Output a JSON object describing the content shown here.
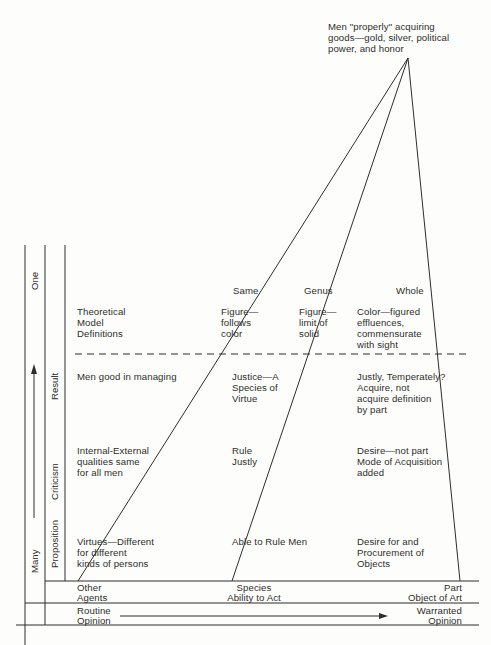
{
  "apex_label": "Men \"properly\" acquiring\ngoods—gold, silver, political\npower, and honor",
  "column_headers": {
    "same": "Same",
    "genus": "Genus",
    "whole": "Whole"
  },
  "side_labels": {
    "one": "One",
    "many": "Many",
    "result": "Result",
    "criticism": "Criticism",
    "proposition": "Proposition"
  },
  "rows": {
    "one": {
      "col1": "Theoretical\nModel\nDefinitions",
      "col2": "Figure—\nfollows\ncolor",
      "col3": "Figure—\nlimit of\nsolid",
      "col4": "Color—figured\neffluences,\ncommensurate\nwith sight"
    },
    "result": {
      "col1": "Men good in managing",
      "col2": "Justice—A\nSpecies of\nVirtue",
      "col4": "Justly, Temperately?\nAcquire, not\nacquire definition\nby part"
    },
    "criticism": {
      "col1": "Internal-External\nqualities same\nfor all men",
      "col2": "Rule\nJustly",
      "col4": "Desire—not part\nMode of Acquisition\nadded"
    },
    "proposition": {
      "col1": "Virtues—Different\nfor different\nkinds of persons",
      "col2": "Able to Rule Men",
      "col4": "Desire for and\nProcurement of\nObjects"
    }
  },
  "base_row": {
    "left": "Other\nAgents",
    "center": "Species\nAbility to Act",
    "right": "Part\nObject of Art"
  },
  "opinion_row": {
    "left": "Routine\nOpinion",
    "right": "Warranted\nOpinion"
  },
  "colors": {
    "ink": "#2d2d2d",
    "paper": "#fdfdfb"
  }
}
